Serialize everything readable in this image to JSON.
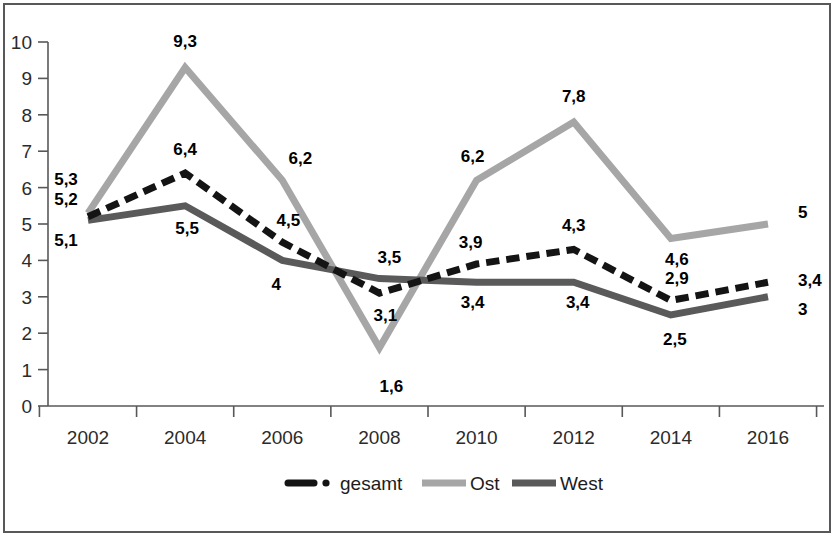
{
  "chart_data": {
    "type": "line",
    "title": "",
    "subtitle": "",
    "xlabel": "",
    "ylabel": "",
    "categories": [
      "2002",
      "2004",
      "2006",
      "2008",
      "2010",
      "2012",
      "2014",
      "2016"
    ],
    "x": [
      2002,
      2004,
      2006,
      2008,
      2010,
      2012,
      2014,
      2016
    ],
    "ylim": [
      0,
      10
    ],
    "yticks": [
      "0",
      "1",
      "2",
      "3",
      "4",
      "5",
      "6",
      "7",
      "8",
      "9",
      "10"
    ],
    "ytick_values": [
      0,
      1,
      2,
      3,
      4,
      5,
      6,
      7,
      8,
      9,
      10
    ],
    "grid": false,
    "legend_position": "bottom",
    "decimal_separator": ",",
    "series": [
      {
        "name": "gesamt",
        "style": "dash-dot",
        "color": "#141414",
        "values": [
          5.2,
          6.4,
          4.5,
          3.1,
          3.9,
          4.3,
          2.9,
          3.4
        ],
        "labels": [
          "5,2",
          "6,4",
          "4,5",
          "3,1",
          "3,9",
          "4,3",
          "2,9",
          "3,4"
        ]
      },
      {
        "name": "Ost",
        "style": "solid",
        "color": "#a6a6a6",
        "values": [
          5.3,
          9.3,
          6.2,
          1.6,
          6.2,
          7.8,
          4.6,
          5.0
        ],
        "labels": [
          "5,3",
          "9,3",
          "6,2",
          "1,6",
          "6,2",
          "7,8",
          "4,6",
          "5"
        ]
      },
      {
        "name": "West",
        "style": "solid",
        "color": "#5a5a5a",
        "values": [
          5.1,
          5.5,
          4.0,
          3.5,
          3.4,
          3.4,
          2.5,
          3.0
        ],
        "labels": [
          "5,1",
          "5,5",
          "4",
          "3,5",
          "3,4",
          "3,4",
          "2,5",
          "3"
        ]
      }
    ]
  },
  "legend": {
    "entries": [
      {
        "label": "gesamt",
        "color": "#141414",
        "style": "dash-dot"
      },
      {
        "label": "Ost",
        "color": "#a6a6a6",
        "style": "solid"
      },
      {
        "label": "West",
        "color": "#5a5a5a",
        "style": "solid"
      }
    ]
  },
  "colors": {
    "axis": "#58585a",
    "frame": "#58585a",
    "background": "#ffffff",
    "gesamt": "#141414",
    "ost": "#a6a6a6",
    "west": "#5a5a5a"
  }
}
